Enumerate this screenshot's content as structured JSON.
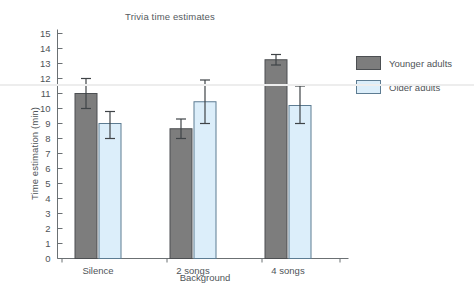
{
  "chart_data": {
    "type": "bar",
    "title": "Trivia time estimates",
    "xlabel": "Background",
    "ylabel": "Time estimation (min)",
    "categories": [
      "Silence",
      "2 songs",
      "4 songs"
    ],
    "ylim": [
      0,
      15
    ],
    "ytick_step": 1,
    "yticks": [
      "0",
      "1",
      "2",
      "3",
      "4",
      "5",
      "6",
      "7",
      "8",
      "9",
      "10",
      "11",
      "12",
      "13",
      "14",
      "15"
    ],
    "grid": false,
    "legend_position": "right",
    "series": [
      {
        "name": "Younger adults",
        "color": "#7d7d7d",
        "edge_color": "#4c4f52",
        "values": [
          11.0,
          8.65,
          13.25
        ],
        "error_low": [
          10.0,
          8.0,
          12.9
        ],
        "error_high": [
          12.0,
          9.3,
          13.6
        ]
      },
      {
        "name": "Older adults",
        "color": "#dceefa",
        "edge_color": "#5d7c92",
        "values": [
          9.0,
          10.45,
          10.2
        ],
        "error_low": [
          8.0,
          9.0,
          9.0
        ],
        "error_high": [
          9.8,
          11.9,
          11.5
        ]
      }
    ]
  },
  "legend": {
    "items": [
      {
        "label": "Younger adults",
        "color": "#7d7d7d"
      },
      {
        "label": "Older adults",
        "color": "#dceefa"
      }
    ]
  }
}
